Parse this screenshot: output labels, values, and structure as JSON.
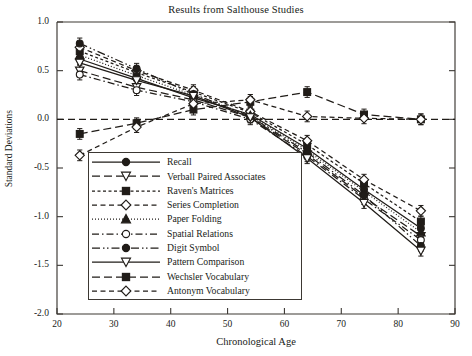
{
  "chart_data": {
    "type": "line",
    "title": "Results from Salthouse Studies",
    "xlabel": "Chronological Age",
    "ylabel": "Standard Deviations",
    "xlim": [
      20,
      90
    ],
    "ylim": [
      -2.0,
      1.0
    ],
    "xticks": [
      20,
      30,
      40,
      50,
      60,
      70,
      80,
      90
    ],
    "yticks": [
      -2.0,
      -1.5,
      -1.0,
      -0.5,
      0.0,
      0.5,
      1.0
    ],
    "xtick_labels": [
      "20",
      "30",
      "40",
      "50",
      "60",
      "70",
      "80",
      "90"
    ],
    "ytick_labels": [
      "-2.0",
      "-1.5",
      "-1.0",
      "-0.5",
      "0.0",
      "0.5",
      "1.0"
    ],
    "grid": false,
    "legend_position": "lower-left-inside",
    "reference_line": {
      "y": 0.0,
      "style": "dashed"
    },
    "error_bars": true,
    "x": [
      24,
      34,
      44,
      54,
      64,
      74,
      84
    ],
    "series": [
      {
        "name": "Recall",
        "marker": "filled-circle",
        "dash": "solid",
        "values": [
          0.62,
          0.42,
          0.22,
          0.05,
          -0.3,
          -0.72,
          -1.12
        ]
      },
      {
        "name": "Verball Paired Associates",
        "marker": "open-triangle-down",
        "dash": "dash-long",
        "values": [
          0.5,
          0.33,
          0.2,
          0.02,
          -0.36,
          -0.8,
          -1.2
        ]
      },
      {
        "name": "Raven's Matrices",
        "marker": "filled-square",
        "dash": "dash-short",
        "values": [
          0.7,
          0.48,
          0.28,
          0.07,
          -0.26,
          -0.66,
          -1.05
        ]
      },
      {
        "name": "Series Completion",
        "marker": "open-diamond",
        "dash": "dash-med",
        "values": [
          0.74,
          0.5,
          0.3,
          0.08,
          -0.22,
          -0.62,
          -0.94
        ]
      },
      {
        "name": "Paper Folding",
        "marker": "filled-triangle-up",
        "dash": "dotted",
        "values": [
          0.66,
          0.45,
          0.25,
          0.04,
          -0.32,
          -0.74,
          -1.16
        ]
      },
      {
        "name": "Spatial Relations",
        "marker": "open-circle",
        "dash": "dash-dot",
        "values": [
          0.46,
          0.3,
          0.18,
          0.0,
          -0.38,
          -0.82,
          -1.24
        ]
      },
      {
        "name": "Digit Symbol",
        "marker": "filled-circle",
        "dash": "dash-dot-dot",
        "values": [
          0.78,
          0.52,
          0.26,
          0.03,
          -0.34,
          -0.78,
          -1.3
        ]
      },
      {
        "name": "Pattern Comparison",
        "marker": "open-triangle-down",
        "dash": "solid",
        "values": [
          0.58,
          0.4,
          0.24,
          0.02,
          -0.4,
          -0.86,
          -1.35
        ]
      },
      {
        "name": "Wechsler Vocabulary",
        "marker": "filled-square",
        "dash": "dash-long",
        "values": [
          -0.15,
          -0.04,
          0.1,
          0.18,
          0.28,
          0.05,
          0.0
        ]
      },
      {
        "name": "Antonym Vocabulary",
        "marker": "open-diamond",
        "dash": "dash-med",
        "values": [
          -0.37,
          -0.08,
          0.16,
          0.2,
          0.03,
          0.01,
          0.0
        ]
      }
    ]
  },
  "legend": {
    "items": [
      {
        "label": "Recall"
      },
      {
        "label": "Verball Paired Associates"
      },
      {
        "label": "Raven's Matrices"
      },
      {
        "label": "Series Completion"
      },
      {
        "label": "Paper Folding"
      },
      {
        "label": "Spatial Relations"
      },
      {
        "label": "Digit Symbol"
      },
      {
        "label": "Pattern Comparison"
      },
      {
        "label": "Wechsler Vocabulary"
      },
      {
        "label": "Antonym Vocabulary"
      }
    ]
  },
  "colors": {
    "ink": "#201c18",
    "axis": "#3c3833",
    "background": "#ffffff"
  }
}
